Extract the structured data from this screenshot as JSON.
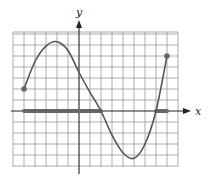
{
  "chart_data": {
    "type": "line",
    "title": "",
    "xlabel": "x",
    "ylabel": "y",
    "xlim": [
      -6,
      9
    ],
    "ylim": [
      -5,
      7
    ],
    "grid": true,
    "grid_step": 1,
    "tick_labels_shown": false,
    "series": [
      {
        "name": "f(x)",
        "x": [
          -5,
          -4,
          -3,
          -2,
          -1,
          0,
          1,
          2,
          3,
          4,
          5,
          6,
          7,
          8
        ],
        "y": [
          2,
          4.5,
          5.9,
          6.3,
          5.5,
          3.5,
          1.7,
          0,
          -2.2,
          -3.8,
          -4.3,
          -3.0,
          0,
          5
        ]
      }
    ],
    "endpoints": [
      {
        "x": -5,
        "y": 2,
        "closed": true
      },
      {
        "x": 8,
        "y": 5,
        "closed": true
      }
    ],
    "shaded_intervals_on_x_axis": [
      {
        "from": -5,
        "to": 2
      },
      {
        "from": 7,
        "to": 8
      }
    ],
    "colors": {
      "curve": "#555555",
      "shade": "#666666",
      "grid": "#9a9a9a",
      "axes": "#222222"
    }
  }
}
